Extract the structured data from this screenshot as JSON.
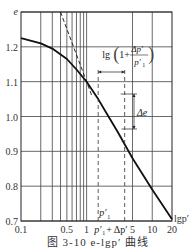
{
  "chart_data": {
    "type": "line",
    "title": "",
    "caption": "图 3-10   e-lgp′ 曲线",
    "xlabel": "lgp′",
    "ylabel": "e",
    "xscale": "log",
    "xlim": [
      0.1,
      20
    ],
    "ylim": [
      0.7,
      1.3
    ],
    "grid": true,
    "x_tick_labels": [
      "0.1",
      "0.5",
      "1",
      "5",
      "10",
      "20"
    ],
    "x_ticks": [
      0.1,
      0.5,
      1,
      5,
      10,
      20
    ],
    "x_minor_gridlines": [
      0.2,
      0.3,
      0.4,
      0.5,
      0.6,
      0.7,
      0.8,
      0.9,
      1,
      5,
      10
    ],
    "y_ticks": [
      0.7,
      0.8,
      0.9,
      1.0,
      1.1,
      1.2
    ],
    "y_tick_labels": [
      "0.7",
      "0.8",
      "0.9",
      "1.0",
      "1.1",
      "1.2"
    ],
    "series": [
      {
        "name": "e-lgp′ curve",
        "style": "solid",
        "x": [
          0.1,
          0.2,
          0.3,
          0.5,
          0.7,
          1.0,
          1.5,
          2,
          3,
          5,
          10,
          20
        ],
        "y": [
          1.225,
          1.21,
          1.195,
          1.165,
          1.135,
          1.1,
          1.05,
          1.01,
          0.955,
          0.88,
          0.79,
          0.705
        ]
      },
      {
        "name": "virgin compression line extension",
        "style": "dashed",
        "x": [
          0.4,
          1.2
        ],
        "y": [
          1.3,
          1.06
        ]
      }
    ],
    "annotations": [
      {
        "text": "lg(1 + Δp′/p′₁)",
        "type": "horizontal-span",
        "from_x": 1.5,
        "to_x": 3.8
      },
      {
        "text": "Δe",
        "type": "vertical-span",
        "from_y": 1.04,
        "to_y": 0.955
      },
      {
        "text": "p′₁",
        "type": "dashed-vertical",
        "x": 1.5
      },
      {
        "text": "p′₁+Δp′",
        "type": "dashed-vertical",
        "x": 3.8
      }
    ]
  },
  "labels": {
    "y_axis": "e",
    "x_axis": "lgp′",
    "p1": "p′",
    "p1_sub": "1",
    "p1dp": "p′",
    "p1dp_rest": "+ Δp′",
    "annot_lg": "lg",
    "annot_one": "1+",
    "annot_num": "Δp′",
    "annot_den": "p′",
    "annot_den_sub": "1",
    "delta_e": "Δe"
  },
  "caption": "图 3-10   e-lgp′ 曲线"
}
